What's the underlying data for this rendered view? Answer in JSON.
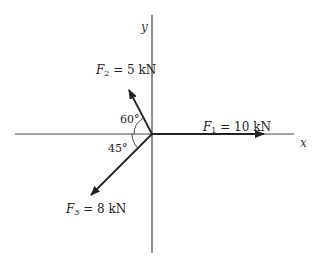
{
  "diagram": {
    "type": "force-vector-diagram",
    "axes": {
      "x_label": "x",
      "y_label": "y"
    },
    "forces": [
      {
        "symbol": "F",
        "subscript": "1",
        "eq": " = ",
        "value": "10 kN",
        "direction": "along +x axis"
      },
      {
        "symbol": "F",
        "subscript": "2",
        "eq": " = ",
        "value": "5 kN",
        "angle": "60°",
        "direction": "60° from −x axis, upper-left"
      },
      {
        "symbol": "F",
        "subscript": "3",
        "eq": " = ",
        "value": "8 kN",
        "angle": "45°",
        "direction": "45° below −x axis, lower-left"
      }
    ],
    "angles": {
      "f2": "60°",
      "f3": "45°"
    },
    "colors": {
      "line": "#222222",
      "axis": "#444444",
      "background": "#ffffff"
    }
  }
}
